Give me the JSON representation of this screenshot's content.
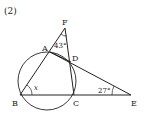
{
  "problem_number": "(2)",
  "points": {
    "A": {
      "label": "A",
      "x": 50,
      "y": 52
    },
    "B": {
      "label": "B",
      "x": 20,
      "y": 95
    },
    "C": {
      "label": "C",
      "x": 74,
      "y": 95
    },
    "D": {
      "label": "D",
      "x": 71,
      "y": 62
    },
    "E": {
      "label": "E",
      "x": 131,
      "y": 95
    },
    "F": {
      "label": "F",
      "x": 65,
      "y": 28
    }
  },
  "circle": {
    "cx": 47,
    "cy": 81,
    "r": 29
  },
  "angles": {
    "AFD": {
      "label": "43°"
    },
    "CEA": {
      "label": "27°"
    },
    "ABC": {
      "label": "x"
    }
  },
  "colors": {
    "stroke": "#222222",
    "background": "#ffffff"
  }
}
